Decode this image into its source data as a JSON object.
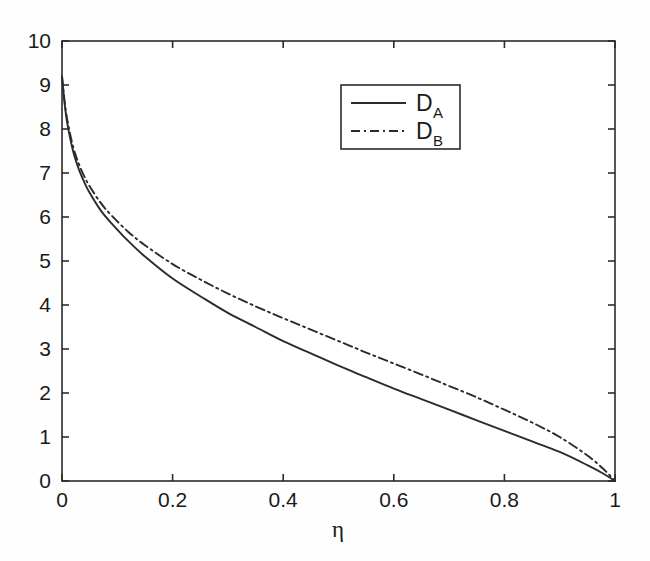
{
  "chart_data": {
    "type": "line",
    "title": "",
    "xlabel": "η",
    "ylabel": "",
    "xlim": [
      0,
      1
    ],
    "ylim": [
      0,
      10
    ],
    "grid": false,
    "legend_position": "upper-center",
    "xticks": [
      "0",
      "0.2",
      "0.4",
      "0.6",
      "0.8",
      "1"
    ],
    "xtick_values": [
      0,
      0.2,
      0.4,
      0.6,
      0.8,
      1
    ],
    "yticks": [
      "0",
      "1",
      "2",
      "3",
      "4",
      "5",
      "6",
      "7",
      "8",
      "9",
      "10"
    ],
    "ytick_values": [
      0,
      1,
      2,
      3,
      4,
      5,
      6,
      7,
      8,
      9,
      10
    ],
    "x": [
      0,
      0.005,
      0.01,
      0.02,
      0.03,
      0.04,
      0.05,
      0.07,
      0.09,
      0.12,
      0.15,
      0.2,
      0.25,
      0.3,
      0.35,
      0.4,
      0.45,
      0.5,
      0.55,
      0.6,
      0.65,
      0.7,
      0.75,
      0.8,
      0.85,
      0.9,
      0.95,
      0.98,
      1
    ],
    "series": [
      {
        "name": "D_A",
        "label": "D",
        "sublabel": "A",
        "style": "solid",
        "color": "#2b2b2b",
        "values": [
          9.2,
          8.55,
          8.1,
          7.5,
          7.1,
          6.8,
          6.55,
          6.15,
          5.85,
          5.45,
          5.1,
          4.6,
          4.2,
          3.82,
          3.5,
          3.18,
          2.9,
          2.62,
          2.36,
          2.1,
          1.86,
          1.62,
          1.38,
          1.14,
          0.9,
          0.66,
          0.36,
          0.16,
          0
        ]
      },
      {
        "name": "D_B",
        "label": "D",
        "sublabel": "B",
        "style": "dash-dot",
        "color": "#2b2b2b",
        "values": [
          9.2,
          8.6,
          8.18,
          7.6,
          7.22,
          6.93,
          6.7,
          6.32,
          6.03,
          5.66,
          5.36,
          4.93,
          4.58,
          4.26,
          3.97,
          3.7,
          3.44,
          3.18,
          2.92,
          2.67,
          2.42,
          2.16,
          1.9,
          1.62,
          1.33,
          1.0,
          0.58,
          0.26,
          0
        ]
      }
    ]
  },
  "legend": {
    "entries": [
      {
        "label": "D",
        "sublabel": "A",
        "style": "solid"
      },
      {
        "label": "D",
        "sublabel": "B",
        "style": "dash-dot"
      }
    ]
  },
  "axis": {
    "x_title": "η"
  }
}
